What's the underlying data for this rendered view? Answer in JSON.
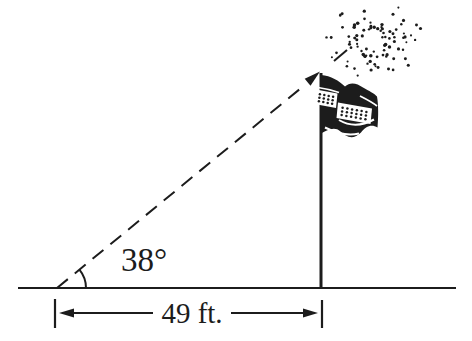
{
  "colors": {
    "ink": "#1c1c1c",
    "paper": "#ffffff"
  },
  "figure": {
    "angle_label": "38°",
    "distance_label": "49 ft."
  }
}
